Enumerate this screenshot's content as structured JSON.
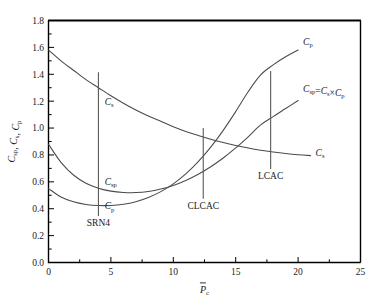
{
  "chart_data": {
    "type": "line",
    "title": "",
    "xlabel": "P̄c",
    "ylabel": "Csp, Cs, Cp",
    "xlim": [
      0,
      25
    ],
    "ylim": [
      0,
      1.8
    ],
    "x_major_ticks": [
      0,
      5,
      10,
      15,
      20,
      25
    ],
    "x_tick_labels": [
      "0",
      "5",
      "10",
      "15",
      "20",
      "25"
    ],
    "x_minor_step": 2.5,
    "y_major_ticks": [
      0.0,
      0.2,
      0.4,
      0.6,
      0.8,
      1.0,
      1.2,
      1.4,
      1.6,
      1.8
    ],
    "y_tick_labels": [
      "0.0",
      "0.2",
      "0.4",
      "0.6",
      "0.8",
      "1.0",
      "1.2",
      "1.4",
      "1.6",
      "1.8"
    ],
    "y_minor_step": 0.1,
    "grid": false,
    "legend_position": "inline-curve-labels",
    "line_color": "#4a4a4a",
    "marker_line_color": "#5a5a5a",
    "axis_color": "#000000",
    "series": [
      {
        "name": "Cs",
        "label": "C_s",
        "x": [
          0,
          1,
          2,
          3,
          4,
          5,
          6,
          7,
          8,
          9,
          10,
          11,
          12,
          13,
          14,
          15,
          16,
          17,
          18,
          19,
          20,
          21
        ],
        "values": [
          1.58,
          1.5,
          1.43,
          1.36,
          1.3,
          1.24,
          1.185,
          1.135,
          1.09,
          1.05,
          1.01,
          0.975,
          0.945,
          0.917,
          0.892,
          0.87,
          0.851,
          0.835,
          0.822,
          0.811,
          0.802,
          0.795
        ]
      },
      {
        "name": "Cp",
        "label": "C_p",
        "x": [
          0,
          1,
          2,
          3,
          4,
          5,
          6,
          7,
          8,
          9,
          10,
          11,
          12,
          13,
          14,
          15,
          16,
          17,
          18,
          19,
          20
        ],
        "values": [
          0.55,
          0.487,
          0.451,
          0.432,
          0.424,
          0.424,
          0.433,
          0.452,
          0.483,
          0.527,
          0.585,
          0.659,
          0.75,
          0.858,
          0.983,
          1.122,
          1.27,
          1.395,
          1.47,
          1.53,
          1.58
        ]
      },
      {
        "name": "Csp",
        "label": "C_sp = C_s × C_p",
        "x": [
          0,
          1,
          2,
          3,
          4,
          5,
          6,
          7,
          8,
          9,
          10,
          11,
          12,
          13,
          14,
          15,
          16,
          17,
          18,
          19,
          20
        ],
        "values": [
          0.88,
          0.745,
          0.651,
          0.59,
          0.553,
          0.531,
          0.521,
          0.52,
          0.528,
          0.546,
          0.573,
          0.61,
          0.656,
          0.712,
          0.777,
          0.852,
          0.935,
          1.023,
          1.085,
          1.145,
          1.205
        ]
      }
    ],
    "markers": [
      {
        "label": "SRN4",
        "x": 4.0,
        "y_top": 1.415,
        "y_bottom": 0.345
      },
      {
        "label": "CLCAC",
        "x": 12.4,
        "y_top": 1.0,
        "y_bottom": 0.475
      },
      {
        "label": "LCAC",
        "x": 17.8,
        "y_top": 1.425,
        "y_bottom": 0.695
      }
    ],
    "curve_labels": [
      {
        "text": "C_p",
        "kind": "cp",
        "x": 20.4,
        "y": 1.62
      },
      {
        "text": "C_sp = C_s × C_p",
        "kind": "csp_eq",
        "x": 20.4,
        "y": 1.27
      },
      {
        "text": "C_s",
        "kind": "cs",
        "x": 21.4,
        "y": 0.795
      },
      {
        "text": "C_s",
        "kind": "cs",
        "x": 4.5,
        "y": 1.17
      },
      {
        "text": "C_sp",
        "kind": "csp",
        "x": 4.5,
        "y": 0.575
      },
      {
        "text": "C_p",
        "kind": "cp",
        "x": 4.5,
        "y": 0.395
      }
    ],
    "axis_labels": {
      "y_parts": [
        "C",
        "sp",
        ", ",
        "C",
        "s",
        ", ",
        "C",
        "p"
      ],
      "x_parts": [
        "P",
        "c"
      ]
    }
  }
}
